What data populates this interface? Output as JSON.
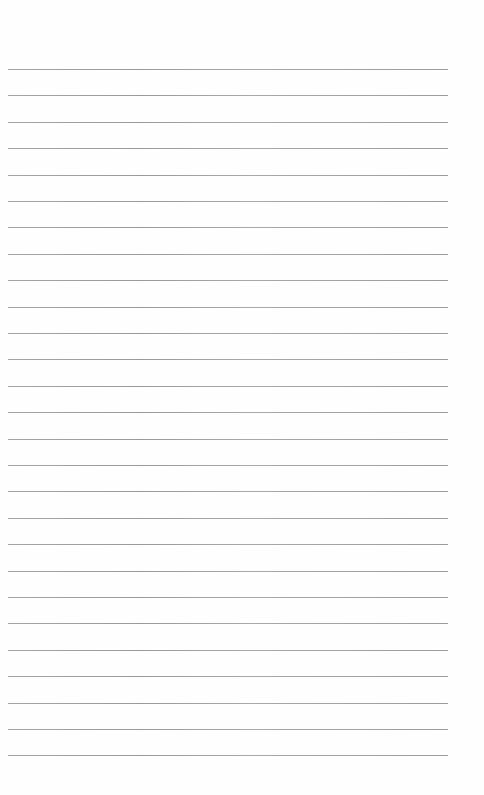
{
  "page": {
    "type": "lined-paper",
    "background_color": "#ffffff",
    "line_color": "#9c9c9c",
    "line_count": 27,
    "line_left": 8,
    "line_width": 440,
    "first_line_y": 69,
    "line_spacing": 26.4,
    "text_content": []
  }
}
